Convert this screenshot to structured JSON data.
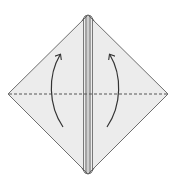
{
  "diagram": {
    "type": "origami-fold-step",
    "description": "Diamond-shaped folded paper with center flap layers; dashed valley fold line horizontally; two curved arrows indicating folding lower flaps upward",
    "colors": {
      "paper_fill": "#ececec",
      "outline": "#6e6e6e",
      "center_lines": "#5a5a5a",
      "fold_line": "#555555",
      "arrow": "#333333",
      "background": "#ffffff"
    },
    "shape": {
      "top": [
        88,
        15
      ],
      "left": [
        8,
        94
      ],
      "right": [
        168,
        94
      ],
      "bottom": [
        88,
        174
      ]
    },
    "fold_line": {
      "style": "dashed",
      "kind": "valley-fold",
      "y": 94,
      "x1": 9,
      "x2": 167
    },
    "arrows": [
      {
        "name": "left-fold-arrow",
        "direction": "up",
        "from": [
          63,
          127
        ],
        "to": [
          60,
          55
        ]
      },
      {
        "name": "right-fold-arrow",
        "direction": "up",
        "from": [
          107,
          127
        ],
        "to": [
          110,
          55
        ]
      }
    ]
  }
}
